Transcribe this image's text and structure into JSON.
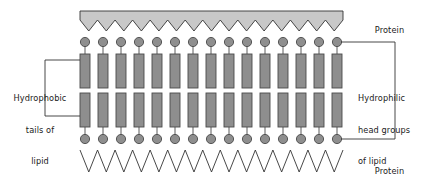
{
  "diagram": {
    "labels": {
      "protein_top": "Protein",
      "protein_bottom": "Protein",
      "hydrophobic_line1": "Hydrophobic",
      "hydrophobic_line2": "tails of",
      "hydrophobic_line3": "lipid",
      "hydrophilic_line1": "Hydrophilic",
      "hydrophilic_line2": "head groups",
      "hydrophilic_line3": "of lipid"
    },
    "colors": {
      "background": "#ffffff",
      "lipid_fill": "#8e8e8e",
      "lipid_stroke": "#4a4a4a",
      "protein_fill": "#c8c8c8",
      "protein_stroke": "#333333",
      "leader_line": "#333333",
      "text": "#1a1a1a"
    },
    "structure": {
      "lipid_column_count": 15,
      "first_column_center_x": 85,
      "column_spacing": 18,
      "head_radius": 4.6,
      "tail_width": 10,
      "upper_tail_top_y": 54,
      "upper_tail_bottom_y": 88,
      "lower_tail_top_y": 93,
      "lower_tail_bottom_y": 127,
      "upper_head_center_y": 42,
      "lower_head_center_y": 139,
      "membrane_left_x": 80,
      "membrane_right_x": 343
    },
    "protein_top": {
      "style": "filled-band-with-zigzag-bottom-edge",
      "left_x": 80,
      "right_x": 343,
      "top_y": 11,
      "zigzag_baseline_y": 20,
      "zigzag_peak_y": 31,
      "teeth": 15
    },
    "protein_bottom": {
      "style": "open-zigzag-line",
      "left_x": 80,
      "right_x": 343,
      "top_y": 150,
      "bottom_y": 172,
      "teeth": 15
    },
    "leaders": {
      "left_bracket": {
        "vertical_x": 45,
        "top_y": 60,
        "bottom_y": 116,
        "top_end_x": 80,
        "bottom_end_x": 80
      },
      "right_bracket": {
        "vertical_x": 395,
        "top_y": 42,
        "bottom_y": 139,
        "start_x": 341
      }
    }
  }
}
